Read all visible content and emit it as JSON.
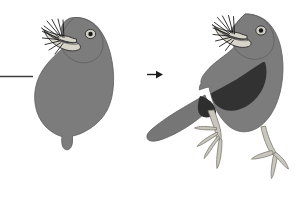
{
  "figure": {
    "title": "Bird reconstruction diagram",
    "description": "Two-panel illustration: a partial bird silhouette on the left transforms, via an arrow, into a complete perching bird with wing, tail and legs on the right.",
    "background_color": "#ffffff",
    "width": 300,
    "height": 201
  },
  "colors": {
    "background": "#ffffff",
    "body_gray": "#7c7c7c",
    "body_gray_edge": "#6e6e6e",
    "wing_dark": "#3a3a3a",
    "tail_gray": "#767676",
    "leg_light": "#c9c6bd",
    "leg_light_shadow": "#b3b0a6",
    "beak_light": "#d7d4c9",
    "outline": "#2b2b2b",
    "eye_white": "#cfcdc4",
    "pupil": "#1a1a1a",
    "bristle": "#111111",
    "rule_line": "#3d3d3d",
    "arrow": "#1c1c1c"
  },
  "panels": [
    {
      "id": "left-panel",
      "label": "Partial bird silhouette",
      "parts": [
        {
          "name": "head",
          "label": "Head"
        },
        {
          "name": "open-beak",
          "label": "Open beak"
        },
        {
          "name": "eye",
          "label": "Eye"
        },
        {
          "name": "rictal-bristles",
          "label": "Rictal bristles"
        },
        {
          "name": "body",
          "label": "Body silhouette"
        },
        {
          "name": "tail-stub",
          "label": "Tail stub"
        }
      ]
    },
    {
      "id": "right-panel",
      "label": "Complete perching bird",
      "parts": [
        {
          "name": "head",
          "label": "Head"
        },
        {
          "name": "open-beak",
          "label": "Open beak"
        },
        {
          "name": "eye",
          "label": "Eye"
        },
        {
          "name": "rictal-bristles",
          "label": "Rictal bristles"
        },
        {
          "name": "body",
          "label": "Body"
        },
        {
          "name": "wing-patch",
          "label": "Folded wing"
        },
        {
          "name": "tail",
          "label": "Tail"
        },
        {
          "name": "front-leg",
          "label": "Front leg and foot"
        },
        {
          "name": "rear-leg",
          "label": "Rear leg and foot"
        }
      ]
    }
  ],
  "annotations": {
    "transition_arrow": {
      "name": "transition-arrow",
      "label": "transforms into",
      "direction": "right"
    },
    "left_rule": {
      "name": "baseline-rule",
      "label": "horizontal reference line"
    }
  }
}
